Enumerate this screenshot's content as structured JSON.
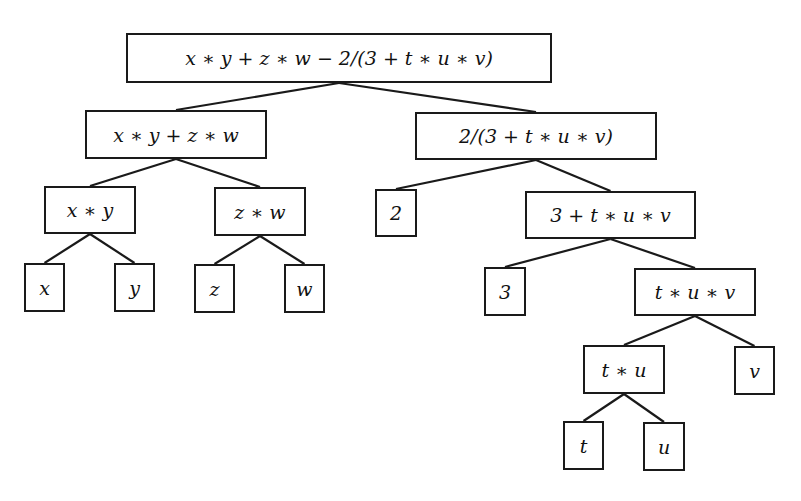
{
  "diagram": {
    "type": "expression-tree",
    "line_color": "#1a1a1a",
    "nodes": [
      {
        "id": "root",
        "label": "x ∗ y + z ∗ w − 2/(3 + t ∗ u ∗ v)",
        "x": 126,
        "y": 33,
        "w": 426,
        "h": 50
      },
      {
        "id": "n1",
        "label": "x ∗ y + z ∗ w",
        "x": 85,
        "y": 110,
        "w": 182,
        "h": 49
      },
      {
        "id": "n2",
        "label": "2/(3 + t ∗ u ∗ v)",
        "x": 415,
        "y": 112,
        "w": 242,
        "h": 48
      },
      {
        "id": "n3",
        "label": "x ∗ y",
        "x": 44,
        "y": 186,
        "w": 92,
        "h": 48
      },
      {
        "id": "n4",
        "label": "z ∗ w",
        "x": 214,
        "y": 187,
        "w": 92,
        "h": 49
      },
      {
        "id": "n5",
        "label": "2",
        "x": 375,
        "y": 189,
        "w": 42,
        "h": 48
      },
      {
        "id": "n6",
        "label": "3 + t ∗ u ∗ v",
        "x": 525,
        "y": 191,
        "w": 171,
        "h": 48
      },
      {
        "id": "n7",
        "label": "x",
        "x": 24,
        "y": 263,
        "w": 41,
        "h": 49
      },
      {
        "id": "n8",
        "label": "y",
        "x": 114,
        "y": 263,
        "w": 41,
        "h": 49
      },
      {
        "id": "n9",
        "label": "z",
        "x": 194,
        "y": 264,
        "w": 41,
        "h": 49
      },
      {
        "id": "n10",
        "label": "w",
        "x": 284,
        "y": 264,
        "w": 41,
        "h": 49
      },
      {
        "id": "n11",
        "label": "3",
        "x": 484,
        "y": 267,
        "w": 42,
        "h": 49
      },
      {
        "id": "n12",
        "label": "t ∗ u ∗ v",
        "x": 634,
        "y": 268,
        "w": 122,
        "h": 48
      },
      {
        "id": "n13",
        "label": "t ∗ u",
        "x": 583,
        "y": 345,
        "w": 82,
        "h": 49
      },
      {
        "id": "n14",
        "label": "v",
        "x": 734,
        "y": 346,
        "w": 41,
        "h": 49
      },
      {
        "id": "n15",
        "label": "t",
        "x": 563,
        "y": 421,
        "w": 41,
        "h": 49
      },
      {
        "id": "n16",
        "label": "u",
        "x": 643,
        "y": 422,
        "w": 42,
        "h": 49
      }
    ],
    "edges": [
      [
        "root",
        "n1"
      ],
      [
        "root",
        "n2"
      ],
      [
        "n1",
        "n3"
      ],
      [
        "n1",
        "n4"
      ],
      [
        "n2",
        "n5"
      ],
      [
        "n2",
        "n6"
      ],
      [
        "n3",
        "n7"
      ],
      [
        "n3",
        "n8"
      ],
      [
        "n4",
        "n9"
      ],
      [
        "n4",
        "n10"
      ],
      [
        "n6",
        "n11"
      ],
      [
        "n6",
        "n12"
      ],
      [
        "n12",
        "n13"
      ],
      [
        "n12",
        "n14"
      ],
      [
        "n13",
        "n15"
      ],
      [
        "n13",
        "n16"
      ]
    ]
  }
}
